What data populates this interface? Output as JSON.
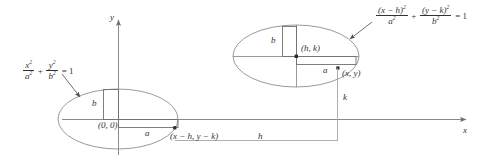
{
  "figure": {
    "background": "#ffffff",
    "line_color": "#808080",
    "text_color": "#333333",
    "axes": {
      "x_label": "x",
      "y_label": "y",
      "origin_label": "(0, 0)"
    },
    "left_ellipse": {
      "equation_text": "x^2/a^2 + y^2/b^2 = 1",
      "equation_parts": {
        "num1": "x",
        "den1": "a",
        "plus": "+",
        "num2": "y",
        "den2": "b",
        "equals": "= 1",
        "exp": "2"
      },
      "semi_minor_label": "b",
      "semi_major_label": "a",
      "center_label": "(0, 0)",
      "point_label": "(x − h, y − k)",
      "center_px": {
        "cx": 118,
        "cy": 119
      },
      "radii_px": {
        "rx": 60,
        "ry": 30
      }
    },
    "right_ellipse": {
      "equation_text": "(x - h)^2/a^2 + (y - k)^2/b^2 = 1",
      "equation_parts": {
        "num1": "(x − h)",
        "den1": "a",
        "plus": "+",
        "num2": "(y − k)",
        "den2": "b",
        "equals": "= 1",
        "exp": "2"
      },
      "semi_minor_label": "b",
      "semi_major_label": "a",
      "center_label": "(h, k)",
      "point_label": "(x, y)",
      "center_px": {
        "cx": 296,
        "cy": 56
      },
      "radii_px": {
        "rx": 63,
        "ry": 31
      }
    },
    "offsets": {
      "horizontal_label": "h",
      "vertical_label": "k"
    }
  }
}
